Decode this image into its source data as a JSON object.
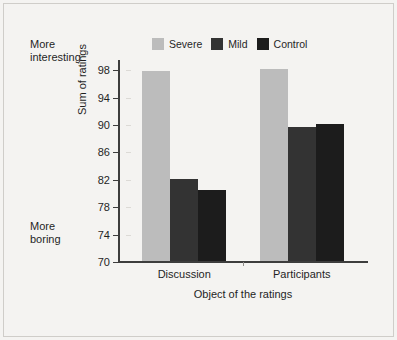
{
  "figure": {
    "background_color": "#f4f3f1",
    "border_color": "#cfcdc9"
  },
  "annotations": {
    "top_note": "More\ninteresting",
    "bottom_note": "More\nboring"
  },
  "legend": {
    "position": "top-center",
    "entries": [
      {
        "label": "Severe",
        "color": "#bcbcbc"
      },
      {
        "label": "Mild",
        "color": "#333333"
      },
      {
        "label": "Control",
        "color": "#1c1c1c"
      }
    ]
  },
  "chart_data": {
    "type": "bar",
    "title": "",
    "subtitle": "",
    "xlabel": "Object of the ratings",
    "ylabel": "Sum of ratings",
    "categories": [
      "Discussion",
      "Participants"
    ],
    "series": [
      {
        "name": "Severe",
        "color": "#bcbcbc",
        "values": [
          97.7,
          98.0
        ]
      },
      {
        "name": "Mild",
        "color": "#333333",
        "values": [
          82.0,
          89.6
        ]
      },
      {
        "name": "Control",
        "color": "#1c1c1c",
        "values": [
          80.4,
          90.0
        ]
      }
    ],
    "ylim": [
      70,
      100
    ],
    "yticks": [
      70,
      74,
      78,
      82,
      86,
      90,
      94,
      98
    ],
    "ytick_labels": [
      "70",
      "74",
      "78",
      "82",
      "86",
      "90",
      "94",
      "98"
    ],
    "grid": false,
    "legend_position": "top-center",
    "annotations": [
      "More interesting",
      "More boring"
    ]
  }
}
